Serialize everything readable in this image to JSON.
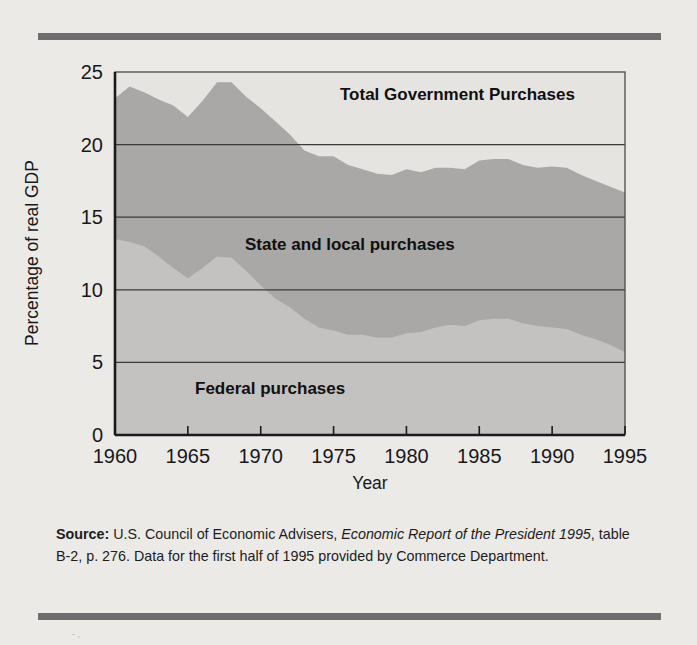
{
  "figure": {
    "background_color": "#eceae7",
    "rule_color": "#6e6e6e"
  },
  "axis": {
    "y_title": "Percentage of real GDP",
    "x_title": "Year",
    "y_ticks": [
      "0",
      "5",
      "10",
      "15",
      "20",
      "25"
    ],
    "x_ticks": [
      "1960",
      "1965",
      "1970",
      "1975",
      "1980",
      "1985",
      "1990",
      "1995"
    ]
  },
  "labels": {
    "total": "Total Government Purchases",
    "state_local": "State and local purchases",
    "federal": "Federal purchases"
  },
  "source": {
    "prefix": "Source:",
    "text_1": " U.S. Council of Economic Advisers, ",
    "italic_1": "Economic Report of the President 1995",
    "text_2": ", table B-2, p. 276. Data for the first half of 1995 provided by Commerce Department."
  },
  "chart_data": {
    "type": "area",
    "title": "",
    "xlabel": "Year",
    "ylabel": "Percentage of real GDP",
    "xlim": [
      1960,
      1995
    ],
    "ylim": [
      0,
      25
    ],
    "grid": true,
    "grid_values": [
      5,
      10,
      15,
      20
    ],
    "legend": "inline-labels",
    "stacked": true,
    "colors": {
      "federal_fill": "#c3c2c0",
      "state_local_fill": "#a9a8a6",
      "plot_background": "#e6e4e1"
    },
    "x": [
      1960,
      1961,
      1962,
      1963,
      1964,
      1965,
      1966,
      1967,
      1968,
      1969,
      1970,
      1971,
      1972,
      1973,
      1974,
      1975,
      1976,
      1977,
      1978,
      1979,
      1980,
      1981,
      1982,
      1983,
      1984,
      1985,
      1986,
      1987,
      1988,
      1989,
      1990,
      1991,
      1992,
      1993,
      1994,
      1995
    ],
    "series": [
      {
        "name": "Federal purchases",
        "values": [
          13.5,
          13.3,
          13.0,
          12.3,
          11.5,
          10.8,
          11.5,
          12.3,
          12.2,
          11.3,
          10.3,
          9.4,
          8.8,
          8.0,
          7.4,
          7.2,
          6.9,
          6.9,
          6.7,
          6.7,
          7.0,
          7.1,
          7.4,
          7.6,
          7.5,
          7.9,
          8.0,
          8.0,
          7.7,
          7.5,
          7.4,
          7.3,
          6.9,
          6.6,
          6.2,
          5.7
        ]
      },
      {
        "name": "State and local purchases",
        "values": [
          9.7,
          10.7,
          10.6,
          10.8,
          11.2,
          11.1,
          11.5,
          12.0,
          12.1,
          12.0,
          12.2,
          12.2,
          11.9,
          11.6,
          11.8,
          12.0,
          11.7,
          11.4,
          11.3,
          11.2,
          11.3,
          11.0,
          11.0,
          10.8,
          10.8,
          11.0,
          11.0,
          11.0,
          10.9,
          10.9,
          11.1,
          11.1,
          11.0,
          10.9,
          10.9,
          11.0
        ]
      }
    ],
    "total": {
      "name": "Total Government Purchases",
      "values": [
        23.2,
        24.0,
        23.6,
        23.1,
        22.7,
        21.9,
        23.0,
        24.3,
        24.3,
        23.3,
        22.5,
        21.6,
        20.7,
        19.6,
        19.2,
        19.2,
        18.6,
        18.3,
        18.0,
        17.9,
        18.3,
        18.1,
        18.4,
        18.4,
        18.3,
        18.9,
        19.0,
        19.0,
        18.6,
        18.4,
        18.5,
        18.4,
        17.9,
        17.5,
        17.1,
        16.7
      ]
    }
  }
}
